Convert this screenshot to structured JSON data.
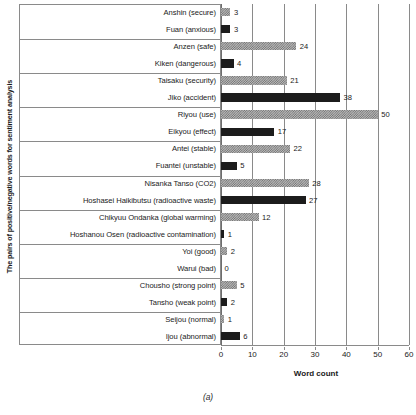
{
  "caption": "(a)",
  "axes": {
    "y_title": "The pairs of positive/negative words for sentiment analysis",
    "x_title": "Word count",
    "x_ticks": [
      "0",
      "10",
      "20",
      "30",
      "40",
      "50",
      "60"
    ]
  },
  "chart_data": {
    "type": "bar",
    "orientation": "horizontal",
    "title": "",
    "xlabel": "Word count",
    "ylabel": "The pairs of positive/negative words for sentiment analysis",
    "xlim": [
      0,
      60
    ],
    "xticks": [
      0,
      10,
      20,
      30,
      40,
      50,
      60
    ],
    "grid": "vertical",
    "legend": "none",
    "series_styles": {
      "positive": "gray-checkered-pattern",
      "negative": "solid-black"
    },
    "categories": [
      "Anshin (secure)",
      "Fuan (anxious)",
      "Anzen (safe)",
      "Kiken (dangerous)",
      "Taisaku (security)",
      "Jiko (accident)",
      "Riyou (use)",
      "Eikyou (effect)",
      "Antei (stable)",
      "Fuantei (unstable)",
      "Nisanka Tanso (CO2)",
      "Hoshasei Haikibutsu (radioactive waste)",
      "Chikyuu Ondanka (global warming)",
      "Hoshanou Osen (radioactive contamination)",
      "Yoi (good)",
      "Warui (bad)",
      "Chousho (strong point)",
      "Tansho (weak point)",
      "Seijou (normal)",
      "Ijou (abnormal)"
    ],
    "values": [
      3,
      3,
      24,
      4,
      21,
      38,
      50,
      17,
      22,
      5,
      28,
      27,
      12,
      1,
      2,
      0,
      5,
      2,
      1,
      6
    ],
    "polarity": [
      "positive",
      "negative",
      "positive",
      "negative",
      "positive",
      "negative",
      "positive",
      "negative",
      "positive",
      "negative",
      "positive",
      "negative",
      "positive",
      "negative",
      "positive",
      "negative",
      "positive",
      "negative",
      "positive",
      "negative"
    ]
  }
}
